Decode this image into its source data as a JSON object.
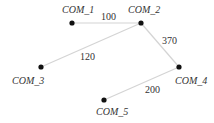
{
  "diagram": {
    "type": "weighted-graph",
    "nodes": [
      {
        "id": "COM_1",
        "label": "COM_1",
        "x": 72,
        "y": 23
      },
      {
        "id": "COM_2",
        "label": "COM_2",
        "x": 141,
        "y": 23
      },
      {
        "id": "COM_3",
        "label": "COM_3",
        "x": 41,
        "y": 67
      },
      {
        "id": "COM_4",
        "label": "COM_4",
        "x": 179,
        "y": 67
      },
      {
        "id": "COM_5",
        "label": "COM_5",
        "x": 104,
        "y": 100
      }
    ],
    "edges": [
      {
        "from": "COM_1",
        "to": "COM_2",
        "weight": "100"
      },
      {
        "from": "COM_2",
        "to": "COM_3",
        "weight": "120"
      },
      {
        "from": "COM_2",
        "to": "COM_4",
        "weight": "370"
      },
      {
        "from": "COM_4",
        "to": "COM_5",
        "weight": "200"
      }
    ],
    "colors": {
      "edge": "#d4d4d4",
      "node": "#111111",
      "text": "#333333"
    }
  }
}
